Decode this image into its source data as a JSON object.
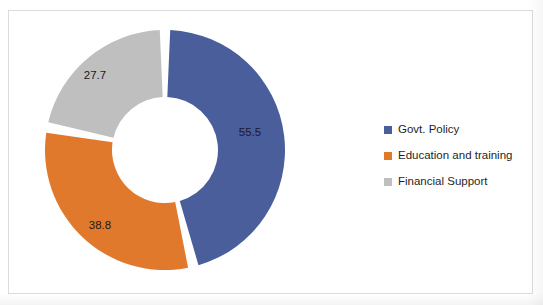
{
  "chart_data": {
    "type": "pie",
    "variant": "doughnut-exploded",
    "title": "",
    "categories": [
      "Govt. Policy",
      "Education and training",
      "Financial Support"
    ],
    "values": [
      55.5,
      38.8,
      27.7
    ],
    "data_labels": [
      "55.5",
      "38.8",
      "27.7"
    ],
    "colors": [
      "#4A5E9C",
      "#E1792C",
      "#BFBFBF"
    ],
    "total": 122.0,
    "legend_position": "right",
    "grid": false,
    "xlabel": "",
    "ylabel": "",
    "slices": [
      {
        "name": "Govt. Policy",
        "value": 55.5,
        "label": "55.5",
        "color": "#4A5E9C",
        "start_angle": 2.5,
        "end_angle": 163.8,
        "label_x": 250,
        "label_y": 133
      },
      {
        "name": "Education and training",
        "value": 38.8,
        "label": "38.8",
        "color": "#E1792C",
        "start_angle": 168.9,
        "end_angle": 278.3,
        "label_x": 100,
        "label_y": 226
      },
      {
        "name": "Financial Support",
        "value": 27.7,
        "label": "27.7",
        "color": "#BFBFBF",
        "start_angle": 283.4,
        "end_angle": 357.5,
        "label_x": 95,
        "label_y": 76
      }
    ],
    "geometry": {
      "center_x": 165,
      "center_y": 150,
      "outer_radius": 120,
      "inner_radius": 53
    }
  },
  "legend": {
    "items": [
      {
        "label": "Govt. Policy",
        "color": "#4A5E9C"
      },
      {
        "label": "Education and training",
        "color": "#E1792C"
      },
      {
        "label": "Financial Support",
        "color": "#BFBFBF"
      }
    ]
  },
  "frame": {
    "border_color": "#DCDCDC",
    "background": "#FFFFFF"
  }
}
